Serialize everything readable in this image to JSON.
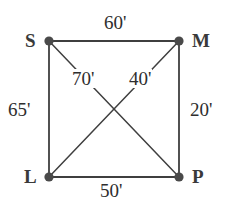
{
  "diagram": {
    "type": "quadrilateral-distance-diagram",
    "stroke_color": "#3f3f3f",
    "vertex_color": "#4a4a4a",
    "background_color": "#ffffff",
    "vertices": [
      {
        "id": "S",
        "label": "S",
        "x": 49,
        "y": 41,
        "label_x": 25,
        "label_y": 31
      },
      {
        "id": "M",
        "label": "M",
        "x": 179,
        "y": 41,
        "label_x": 192,
        "label_y": 31
      },
      {
        "id": "L",
        "label": "L",
        "x": 49,
        "y": 177,
        "label_x": 24,
        "label_y": 167
      },
      {
        "id": "P",
        "label": "P",
        "x": 179,
        "y": 177,
        "label_x": 192,
        "label_y": 167
      }
    ],
    "edges": [
      {
        "id": "SM",
        "from": "S",
        "to": "M",
        "label": "60'",
        "kind": "side"
      },
      {
        "id": "MP",
        "from": "M",
        "to": "P",
        "label": "20'",
        "kind": "side"
      },
      {
        "id": "LP",
        "from": "L",
        "to": "P",
        "label": "50'",
        "kind": "side"
      },
      {
        "id": "SL",
        "from": "S",
        "to": "L",
        "label": "65'",
        "kind": "side"
      },
      {
        "id": "SP",
        "from": "S",
        "to": "P",
        "label": "70'",
        "kind": "diagonal"
      },
      {
        "id": "ML",
        "from": "M",
        "to": "L",
        "label": "40'",
        "kind": "diagonal"
      }
    ],
    "labels": {
      "vertex_S": "S",
      "vertex_M": "M",
      "vertex_L": "L",
      "vertex_P": "P",
      "side_top": "60'",
      "side_right": "20'",
      "side_bottom": "50'",
      "side_left": "65'",
      "diagonal_sp": "70'",
      "diagonal_ml": "40'"
    }
  }
}
